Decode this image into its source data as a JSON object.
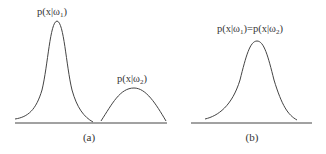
{
  "panels": [
    {
      "caption": "(a)",
      "curves": [
        {
          "label_prefix": "p(x|ω",
          "label_sub": "1",
          "label_suffix": ")",
          "description": "tall narrow peak"
        },
        {
          "label_prefix": "p(x|ω",
          "label_sub": "2",
          "label_suffix": ")",
          "description": "short wide peak"
        }
      ]
    },
    {
      "caption": "(b)",
      "curves": [
        {
          "label_a_prefix": "p(x|ω",
          "label_a_sub": "1",
          "label_a_suffix": ")",
          "equals": "=",
          "label_b_prefix": "p(x|ω",
          "label_b_sub": "2",
          "label_b_suffix": ")",
          "description": "single identical peak"
        }
      ]
    }
  ],
  "colors": {
    "stroke": "#444444",
    "text": "#333333",
    "background": "#ffffff"
  }
}
